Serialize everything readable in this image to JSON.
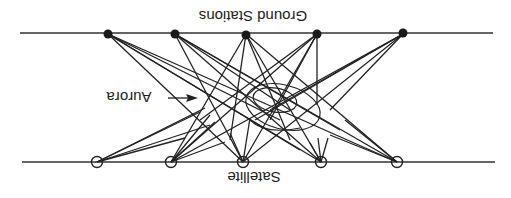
{
  "diagram": {
    "orientation": "rotated 180 degrees (upside down)",
    "labels": {
      "ground_stations": "Ground Stations",
      "satellite": "Satellite",
      "aurora": "Aurora"
    },
    "ground_line": {
      "x1": 20,
      "x2": 493,
      "y": 33
    },
    "satellite_line": {
      "x1": 22,
      "x2": 495,
      "y": 162
    },
    "ground_stations": [
      {
        "id": "G1",
        "x": 108,
        "y": 34
      },
      {
        "id": "G2",
        "x": 175,
        "y": 34
      },
      {
        "id": "G3",
        "x": 246,
        "y": 35
      },
      {
        "id": "G4",
        "x": 317,
        "y": 34
      },
      {
        "id": "G5",
        "x": 403,
        "y": 33
      }
    ],
    "satellites": [
      {
        "id": "S1",
        "x": 97,
        "y": 162
      },
      {
        "id": "S2",
        "x": 171,
        "y": 162
      },
      {
        "id": "S3",
        "x": 243,
        "y": 162
      },
      {
        "id": "S4",
        "x": 321,
        "y": 162
      },
      {
        "id": "S5",
        "x": 397,
        "y": 162
      }
    ],
    "links": [
      [
        108,
        34,
        397,
        162
      ],
      [
        108,
        34,
        321,
        162
      ],
      [
        108,
        34,
        243,
        162
      ],
      [
        108,
        34,
        300,
        150
      ],
      [
        108,
        34,
        280,
        120
      ],
      [
        175,
        34,
        397,
        162
      ],
      [
        175,
        34,
        321,
        162
      ],
      [
        175,
        34,
        243,
        162
      ],
      [
        175,
        34,
        340,
        130
      ],
      [
        175,
        34,
        290,
        110
      ],
      [
        246,
        34,
        171,
        162
      ],
      [
        246,
        34,
        321,
        162
      ],
      [
        246,
        34,
        397,
        162
      ],
      [
        246,
        34,
        230,
        140
      ],
      [
        246,
        34,
        290,
        140
      ],
      [
        317,
        34,
        243,
        162
      ],
      [
        317,
        34,
        171,
        162
      ],
      [
        317,
        34,
        317,
        105
      ],
      [
        317,
        34,
        270,
        120
      ],
      [
        317,
        34,
        200,
        120
      ],
      [
        403,
        34,
        243,
        162
      ],
      [
        403,
        34,
        171,
        162
      ],
      [
        403,
        34,
        270,
        110
      ],
      [
        403,
        34,
        255,
        120
      ],
      [
        403,
        34,
        330,
        110
      ]
    ],
    "stubs": [
      [
        97,
        162,
        205,
        108
      ],
      [
        97,
        162,
        200,
        112
      ],
      [
        97,
        162,
        185,
        138
      ],
      [
        97,
        162,
        210,
        125
      ],
      [
        171,
        162,
        210,
        115
      ],
      [
        171,
        162,
        215,
        122
      ],
      [
        171,
        162,
        225,
        142
      ],
      [
        243,
        162,
        230,
        133
      ],
      [
        243,
        162,
        250,
        118
      ],
      [
        321,
        162,
        310,
        143
      ],
      [
        321,
        162,
        318,
        138
      ],
      [
        321,
        162,
        328,
        138
      ],
      [
        397,
        162,
        330,
        135
      ],
      [
        397,
        162,
        345,
        120
      ]
    ],
    "aurora_arrow": {
      "x1": 168,
      "y1": 97,
      "x2": 197,
      "y2": 97
    }
  }
}
